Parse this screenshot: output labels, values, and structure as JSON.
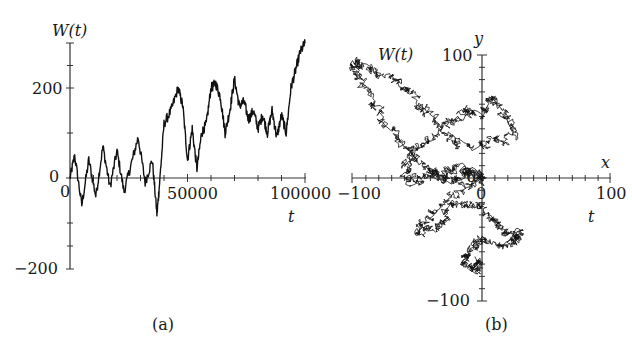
{
  "chart_data": [
    {
      "panel": "a",
      "type": "line",
      "caption": "(a)",
      "title": "",
      "xlabel": "t",
      "ylabel": "W(t)",
      "xlim": [
        0,
        100000
      ],
      "ylim": [
        -200,
        300
      ],
      "x_ticks": [
        "0",
        "50000",
        "100000"
      ],
      "y_ticks": [
        "-200",
        "0",
        "200"
      ],
      "origin_label": "0",
      "grid": false,
      "legend": null,
      "series": [
        {
          "name": "W(t) one-dimensional random walk",
          "x": [
            0,
            2000,
            5000,
            8000,
            11000,
            14000,
            17000,
            20000,
            23000,
            26000,
            29000,
            32000,
            35000,
            37000,
            38000,
            40000,
            43000,
            46000,
            48000,
            50000,
            52000,
            54000,
            56000,
            58000,
            60000,
            62000,
            64000,
            66000,
            68000,
            70000,
            72000,
            74000,
            76000,
            78000,
            80000,
            82000,
            84000,
            86000,
            88000,
            90000,
            92000,
            94000,
            96000,
            98000,
            100000
          ],
          "values": [
            0,
            50,
            -60,
            40,
            -40,
            70,
            -20,
            60,
            -30,
            30,
            90,
            -10,
            40,
            -80,
            -20,
            120,
            150,
            200,
            160,
            40,
            110,
            20,
            100,
            120,
            200,
            210,
            180,
            100,
            150,
            220,
            160,
            170,
            130,
            150,
            110,
            140,
            100,
            150,
            90,
            140,
            100,
            200,
            240,
            280,
            300
          ]
        }
      ]
    },
    {
      "panel": "b",
      "type": "line",
      "caption": "(b)",
      "title": "",
      "xlabel": "x",
      "ylabel": "y",
      "extra_labels": [
        "W(t)",
        "t"
      ],
      "xlim": [
        -100,
        100
      ],
      "ylim": [
        -100,
        100
      ],
      "x_ticks": [
        "-100",
        "0",
        "100"
      ],
      "y_ticks": [
        "-100",
        "100"
      ],
      "origin_label": "0",
      "grid": false,
      "legend": null,
      "series": [
        {
          "name": "W(t) two-dimensional random walk (x, y)",
          "x": [
            0,
            -10,
            -25,
            -40,
            -55,
            -70,
            -85,
            -95,
            -100,
            -90,
            -70,
            -55,
            -45,
            -30,
            -15,
            -5,
            5,
            15,
            25,
            10,
            -10,
            -30,
            -50,
            -60,
            -55,
            -40,
            -30,
            -20,
            -10,
            0,
            -20,
            -40,
            -50,
            -35,
            -25,
            -10,
            5,
            15,
            25,
            30,
            15,
            0,
            -10,
            -15,
            -5,
            0
          ],
          "y": [
            0,
            5,
            -3,
            5,
            20,
            40,
            60,
            80,
            95,
            90,
            80,
            70,
            55,
            40,
            55,
            50,
            65,
            55,
            35,
            30,
            25,
            35,
            25,
            10,
            -5,
            5,
            0,
            10,
            5,
            0,
            -10,
            -30,
            -45,
            -40,
            -25,
            -20,
            -30,
            -40,
            -50,
            -45,
            -55,
            -50,
            -60,
            -70,
            -75,
            -65
          ]
        }
      ]
    }
  ],
  "panel_a": {
    "ylabel": "W(t)",
    "xlabel": "t",
    "y_tick_200": "200",
    "y_tick_0": "0",
    "y_tick_neg200": "−200",
    "x_tick_0": "0",
    "x_tick_50000": "50000",
    "x_tick_100000": "100000",
    "caption": "(a)"
  },
  "panel_b": {
    "ylabel": "y",
    "xlabel": "x",
    "series_label": "W(t)",
    "t_label": "t",
    "y_tick_100": "100",
    "y_tick_neg100": "−100",
    "x_tick_neg100": "−100",
    "x_tick_0": "0",
    "x_tick_100": "100",
    "origin_0": "0",
    "caption": "(b)"
  }
}
